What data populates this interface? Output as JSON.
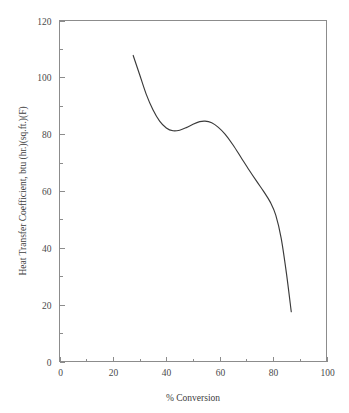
{
  "chart_data": {
    "type": "line",
    "title": "",
    "xlabel": "% Conversion",
    "ylabel": "Heat Transfer Coefficient, btu (hr.)(sq.ft.)(F)",
    "xlim": [
      0,
      100
    ],
    "ylim": [
      0,
      120
    ],
    "xticks": [
      0,
      20,
      40,
      60,
      80,
      100
    ],
    "yticks": [
      0,
      20,
      40,
      60,
      80,
      100,
      120
    ],
    "xtick_labels": [
      "0",
      "20",
      "40",
      "60",
      "80",
      "100"
    ],
    "ytick_labels": [
      "0",
      "20",
      "40",
      "60",
      "80",
      "100",
      "120"
    ],
    "x_minor_tick_interval": 10,
    "y_minor_tick_interval": 10,
    "grid": false,
    "legend": false,
    "series": [
      {
        "name": "Heat transfer coefficient vs conversion",
        "color": "#3a3a3a",
        "x": [
          27.6,
          30.0,
          32.5,
          35.0,
          37.5,
          40.0,
          42.5,
          45.0,
          47.5,
          50.0,
          52.5,
          54.5,
          57.0,
          59.5,
          62.0,
          65.0,
          68.0,
          71.0,
          74.0,
          76.5,
          79.0,
          81.0,
          83.0,
          85.0,
          86.8
        ],
        "y": [
          107.7,
          101.0,
          94.0,
          88.6,
          84.6,
          82.2,
          81.2,
          81.4,
          82.3,
          83.5,
          84.4,
          84.6,
          84.0,
          82.4,
          80.0,
          76.2,
          71.8,
          67.4,
          63.2,
          59.8,
          56.0,
          51.5,
          43.5,
          31.0,
          17.5
        ]
      }
    ]
  },
  "axes": {
    "x_axis_name": "x-axis",
    "y_axis_name": "y-axis",
    "frame_color": "#8c8c8c"
  }
}
